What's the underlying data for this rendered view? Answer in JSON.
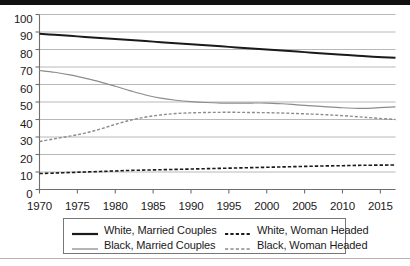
{
  "chart_data": {
    "type": "line",
    "title": "",
    "subtitle": "",
    "xlabel": "",
    "ylabel": "",
    "xlim": [
      1970,
      2017
    ],
    "ylim": [
      0,
      100
    ],
    "grid": "horizontal",
    "legend_position": "bottom",
    "x_ticks": [
      "1970",
      "1975",
      "1980",
      "1985",
      "1990",
      "1995",
      "2000",
      "2005",
      "2010",
      "2015"
    ],
    "x_tick_values": [
      1970,
      1975,
      1980,
      1985,
      1990,
      1995,
      2000,
      2005,
      2010,
      2015
    ],
    "y_ticks": [
      "0",
      "10",
      "20",
      "30",
      "40",
      "50",
      "60",
      "70",
      "80",
      "90",
      "100"
    ],
    "y_tick_values": [
      0,
      10,
      20,
      30,
      40,
      50,
      60,
      70,
      80,
      90,
      100
    ],
    "x": [
      1970,
      1972,
      1974,
      1976,
      1978,
      1980,
      1982,
      1984,
      1986,
      1988,
      1990,
      1992,
      1994,
      1996,
      1998,
      2000,
      2002,
      2004,
      2006,
      2008,
      2010,
      2012,
      2014,
      2017
    ],
    "series": [
      {
        "name": "White, Married Couples",
        "color": "#1a1a1a",
        "style": "solid",
        "width": 2.0,
        "values": [
          89.0,
          88.4,
          87.8,
          87.2,
          86.6,
          86.0,
          85.4,
          84.8,
          84.2,
          83.6,
          83.0,
          82.4,
          81.8,
          81.2,
          80.6,
          80.0,
          79.4,
          78.8,
          78.2,
          77.6,
          77.0,
          76.4,
          75.9,
          75.3
        ]
      },
      {
        "name": "Black, Married Couples",
        "color": "#8c8c8c",
        "style": "solid",
        "width": 1.2,
        "values": [
          68.0,
          67.0,
          65.5,
          63.6,
          61.5,
          59.0,
          56.4,
          54.0,
          52.2,
          51.0,
          50.2,
          49.7,
          49.4,
          49.3,
          49.4,
          49.4,
          49.0,
          48.4,
          47.8,
          47.2,
          46.7,
          46.4,
          46.5,
          47.2
        ]
      },
      {
        "name": "White, Woman Headed",
        "color": "#1a1a1a",
        "style": "dashed",
        "width": 1.6,
        "values": [
          9.1,
          9.4,
          9.7,
          10.0,
          10.3,
          10.6,
          10.9,
          11.1,
          11.3,
          11.5,
          11.7,
          11.9,
          12.1,
          12.3,
          12.5,
          12.7,
          12.9,
          13.1,
          13.3,
          13.5,
          13.6,
          13.8,
          13.9,
          14.0
        ]
      },
      {
        "name": "Black, Woman Headed",
        "color": "#8c8c8c",
        "style": "dashed",
        "width": 1.4,
        "values": [
          27.4,
          29.0,
          30.5,
          32.2,
          34.5,
          37.2,
          39.6,
          41.4,
          42.6,
          43.4,
          43.8,
          44.0,
          44.1,
          44.1,
          44.0,
          43.9,
          43.7,
          43.4,
          43.1,
          42.7,
          42.2,
          41.6,
          40.9,
          40.0
        ]
      }
    ]
  },
  "legend": {
    "entries": [
      {
        "label": "White, Married Couples",
        "swatch": "solid-black-thick"
      },
      {
        "label": "White, Woman Headed",
        "swatch": "dashed-black"
      },
      {
        "label": "Black, Married Couples",
        "swatch": "solid-gray"
      },
      {
        "label": "Black, Woman Headed",
        "swatch": "dashed-gray"
      }
    ]
  },
  "colors": {
    "black_line": "#1a1a1a",
    "gray_line": "#8c8c8c",
    "grid": "#b0b0b0",
    "axis": "#6e6e6e",
    "top_rule": "#111111"
  }
}
